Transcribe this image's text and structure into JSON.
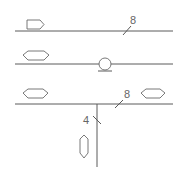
{
  "diagram": {
    "type": "pipe-schematic",
    "colors": {
      "line": "#5a5a5a",
      "symbol": "#6a6a6a",
      "text": "#666666",
      "background": "#ffffff"
    },
    "lines": [
      {
        "id": "line-1",
        "y": 31,
        "x1": 15,
        "x2": 173
      },
      {
        "id": "line-2",
        "y": 64,
        "x1": 15,
        "x2": 173
      },
      {
        "id": "line-3",
        "y": 104,
        "x1": 15,
        "x2": 173
      }
    ],
    "branch": {
      "x": 97,
      "y1": 104,
      "y2": 167
    },
    "symbols": [
      {
        "type": "single-arrow-right",
        "line": 1
      },
      {
        "type": "double-arrow-horizontal",
        "line": 2
      },
      {
        "type": "circle-pump",
        "line": 2
      },
      {
        "type": "double-arrow-horizontal",
        "line": 3,
        "position": "left"
      },
      {
        "type": "double-arrow-horizontal",
        "line": 3,
        "position": "right"
      },
      {
        "type": "double-arrow-vertical",
        "line": "branch"
      }
    ],
    "labels": {
      "line1_size": "8",
      "line3_size": "8",
      "branch_size": "4"
    }
  }
}
